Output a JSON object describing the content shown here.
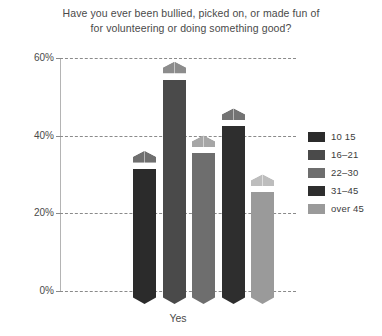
{
  "chart_data": {
    "type": "bar",
    "title": "Have you ever been bullied, picked on, or made fun of for volunteering or doing something good?",
    "title_line1": "Have you ever been bullied, picked on, or made fun of",
    "title_line2": "for volunteering or doing something good?",
    "xlabel": "Yes",
    "ylabel": "",
    "categories": [
      "Yes"
    ],
    "legend_position": "right",
    "grid": true,
    "ylim": [
      0,
      60
    ],
    "yticks": [
      0,
      20,
      40,
      60
    ],
    "ytick_labels": [
      "0%",
      "20%",
      "40%",
      "60%"
    ],
    "series": [
      {
        "name": "10  15",
        "values": [
          33
        ],
        "color": "#2b2b2b",
        "cap_color": "#6f6f6f"
      },
      {
        "name": "16–21",
        "values": [
          56
        ],
        "color": "#4a4a4a",
        "cap_color": "#8c8c8c"
      },
      {
        "name": "22–30",
        "values": [
          37
        ],
        "color": "#6e6e6e",
        "cap_color": "#a6a6a6"
      },
      {
        "name": "31–45",
        "values": [
          44
        ],
        "color": "#2e2e2e",
        "cap_color": "#737373"
      },
      {
        "name": "over 45",
        "values": [
          27
        ],
        "color": "#9a9a9a",
        "cap_color": "#bdbdbd"
      }
    ]
  },
  "axis": {
    "tick_0": "0%",
    "tick_20": "20%",
    "tick_40": "40%",
    "tick_60": "60%"
  },
  "colors": {
    "background": "#ffffff",
    "text": "#4a4a4a",
    "gridline": "#8a8a8a",
    "axis": "#b4b4b4"
  }
}
